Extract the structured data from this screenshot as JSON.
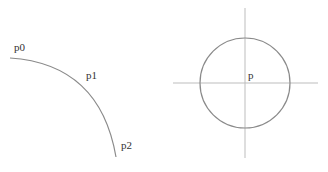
{
  "left_figure": {
    "labels": {
      "p0": "p0",
      "p1": "p1",
      "p2": "p2"
    },
    "curve": {
      "start": [
        10,
        58
      ],
      "control": [
        100,
        64
      ],
      "end": [
        116,
        157
      ],
      "color": "#8a8a8a"
    }
  },
  "right_figure": {
    "labels": {
      "p": "p"
    },
    "circle": {
      "cx": 245,
      "cy": 83,
      "r": 45,
      "color": "#8a8a8a"
    },
    "axes": {
      "color": "#bdbdbd"
    }
  }
}
